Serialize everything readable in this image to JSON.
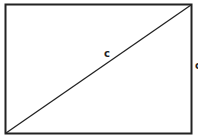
{
  "diagram": {
    "type": "rectangle-with-diagonal",
    "rectangle": {
      "x": 5,
      "y": 4,
      "width": 187,
      "height": 130
    },
    "diagonal": {
      "from": "bottom-left",
      "to": "top-right"
    },
    "labels": {
      "diagonal": "c",
      "right_side": "c"
    },
    "colors": {
      "stroke": "#222222",
      "background": "#ffffff"
    }
  }
}
